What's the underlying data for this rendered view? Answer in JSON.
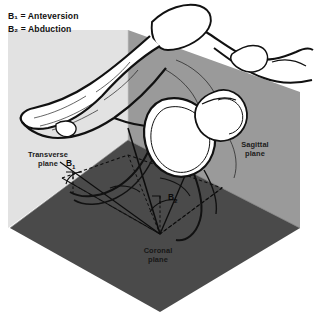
{
  "figure": {
    "type": "anatomical-plane-diagram",
    "background_color": "#ffffff"
  },
  "legend": {
    "items": [
      {
        "symbol": "B",
        "subscript": "1",
        "equals": "=",
        "label": "Anteversion",
        "full_text": "B₁ = Anteversion"
      },
      {
        "symbol": "B",
        "subscript": "2",
        "equals": "=",
        "label": "Abduction",
        "full_text": "B₂ = Abduction"
      }
    ]
  },
  "planes": [
    {
      "name": "transverse",
      "label_line1": "Transverse",
      "label_line2": "plane",
      "color": "#e2e2e2",
      "position": "left",
      "polygon": "8,30 128,30 128,140 8,228"
    },
    {
      "name": "sagittal",
      "label_line1": "Sagittal",
      "label_line2": "plane",
      "color": "#9a9a9a",
      "position": "right",
      "polygon": "128,30 300,92 300,228 128,140"
    },
    {
      "name": "coronal",
      "label_line1": "Coronal",
      "label_line2": "plane",
      "color": "#4a4a4a",
      "position": "bottom",
      "polygon": "128,140 300,228 160,312 10,228"
    }
  ],
  "annotations": {
    "b1": {
      "text": "B",
      "subscript": "1",
      "meaning": "Anteversion",
      "x": 66,
      "y": 158
    },
    "b2": {
      "text": "B",
      "subscript": "2",
      "meaning": "Abduction",
      "x": 168,
      "y": 192
    }
  },
  "colors": {
    "transverse_plane": "#e2e2e2",
    "sagittal_plane": "#9a9a9a",
    "coronal_plane": "#4a4a4a",
    "bone_outline": "#111111",
    "bone_fill": "#ffffff",
    "text_dark": "#111111",
    "construction_line": "#0d0d0d"
  }
}
